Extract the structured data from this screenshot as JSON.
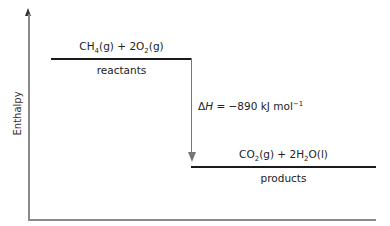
{
  "diagram": {
    "type": "enthalpy-level-diagram",
    "y_axis_label": "Enthalpy",
    "reactants": {
      "formula_parts": [
        {
          "text": "CH"
        },
        {
          "sub": "4"
        },
        {
          "text": "(g) + 2O"
        },
        {
          "sub": "2"
        },
        {
          "text": "(g)"
        }
      ],
      "formula_plain": "CH4(g) + 2O2(g)",
      "label": "reactants"
    },
    "products": {
      "formula_parts": [
        {
          "text": "CO"
        },
        {
          "sub": "2"
        },
        {
          "text": "(g) + 2H"
        },
        {
          "sub": "2"
        },
        {
          "text": "O(l)"
        }
      ],
      "formula_plain": "CO2(g) + 2H2O(l)",
      "label": "products"
    },
    "enthalpy_change": {
      "symbol": "ΔH",
      "equals": " = −890 kJ mol",
      "exponent": "−1",
      "plain": "ΔH = −890 kJ mol−1"
    },
    "colors": {
      "level_line": "#1a1a1a",
      "axis": "#8a8a8a",
      "arrow": "#777777"
    }
  }
}
